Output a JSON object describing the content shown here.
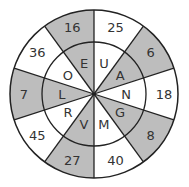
{
  "puzzle": {
    "type": "letter-number wheel",
    "center": [
      94,
      94
    ],
    "outer_radius": 84,
    "inner_radius": 52,
    "colors": {
      "shaded": "#bdbdbd",
      "plain": "#ffffff",
      "stroke": "#222222"
    },
    "sectors": [
      {
        "letter": "U",
        "number": "25",
        "shaded": false
      },
      {
        "letter": "A",
        "number": "6",
        "shaded": true
      },
      {
        "letter": "N",
        "number": "18",
        "shaded": false
      },
      {
        "letter": "G",
        "number": "8",
        "shaded": true
      },
      {
        "letter": "M",
        "number": "40",
        "shaded": false
      },
      {
        "letter": "V",
        "number": "27",
        "shaded": true
      },
      {
        "letter": "R",
        "number": "45",
        "shaded": false
      },
      {
        "letter": "L",
        "number": "7",
        "shaded": true
      },
      {
        "letter": "O",
        "number": "36",
        "shaded": false
      },
      {
        "letter": "E",
        "number": "16",
        "shaded": true
      }
    ]
  }
}
